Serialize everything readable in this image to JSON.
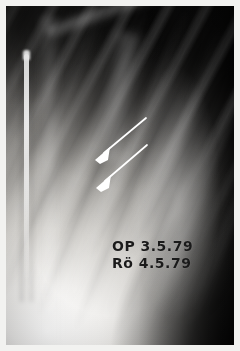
{
  "figure": {
    "modality": "radiograph",
    "view": "chest-ap-right-hemithorax",
    "border_color": "#f2f2f0"
  },
  "annotations": {
    "operation": {
      "label": "OP 3.5.79",
      "name": "operation-date-annotation",
      "meaning": "Operation date"
    },
    "radiograph": {
      "label": "Rö 4.5.79",
      "name": "radiograph-date-annotation",
      "meaning": "Roentgen (X-ray) date"
    },
    "arrows": [
      {
        "name": "upper-marker-arrow",
        "color": "#ffffff",
        "tail": {
          "x": 146,
          "y": 118
        },
        "tip": {
          "x": 95,
          "y": 160
        }
      },
      {
        "name": "lower-marker-arrow",
        "color": "#ffffff",
        "tail": {
          "x": 147,
          "y": 145
        },
        "tip": {
          "x": 96,
          "y": 188
        }
      }
    ],
    "device": {
      "name": "vertical-radiopaque-rod",
      "color": "#ffffff"
    }
  }
}
